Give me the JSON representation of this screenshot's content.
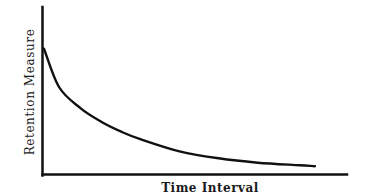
{
  "chart_data": {
    "type": "line",
    "title": "",
    "xlabel": "Time Interval",
    "ylabel": "Retention Measure",
    "x_ticks": [],
    "y_ticks": [],
    "grid": false,
    "legend": null,
    "series": [
      {
        "name": "Retention",
        "x": [
          0,
          0.05,
          0.12,
          0.19,
          0.26,
          0.32,
          0.45,
          0.58,
          0.71,
          0.85,
          0.9
        ],
        "y": [
          0.72,
          0.5,
          0.38,
          0.3,
          0.24,
          0.2,
          0.13,
          0.09,
          0.065,
          0.05,
          0.045
        ]
      }
    ],
    "xlim": [
      0,
      1
    ],
    "ylim": [
      0,
      1
    ]
  },
  "colors": {
    "axis": "#111111",
    "curve": "#111111",
    "background": "#ffffff"
  }
}
